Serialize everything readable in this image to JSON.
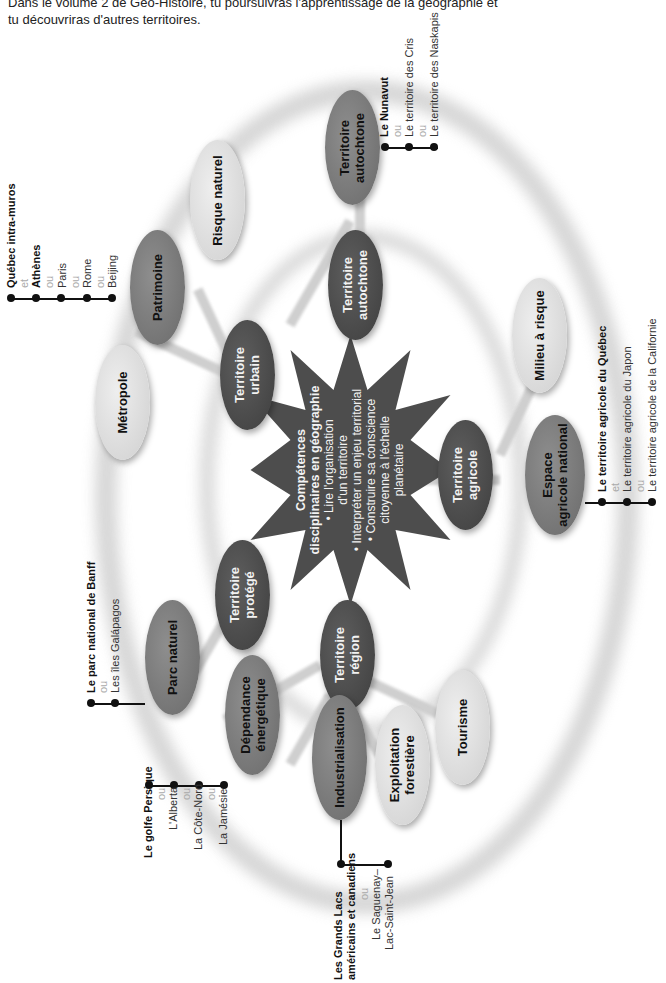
{
  "intro": {
    "line1": "Dans le volume 2 de Géo-Histoire, tu poursuivras l'apprentissage de la géographie et",
    "line2": "tu découvriras d'autres territoires."
  },
  "center": {
    "title_line1": "Compétences",
    "title_line2": "disciplinaires en géographie",
    "bullets": [
      "• Lire l'organisation",
      "d'un territoire",
      "• Interpréter un enjeu territorial",
      "• Construire sa conscience",
      "citoyenne à l'échelle",
      "planétaire"
    ]
  },
  "nodes": {
    "urbain": "Territoire\nurbain",
    "autochtone_inner": "Territoire\nautochtone",
    "agricole": "Territoire\nagricole",
    "region": "Territoire\nrégion",
    "protege": "Territoire\nprotégé",
    "metropole": "Métropole",
    "patrimoine": "Patrimoine",
    "risque_naturel": "Risque naturel",
    "autochtone_outer": "Territoire\nautochtone",
    "milieu_risque": "Milieu à risque",
    "espace_agricole": "Espace\nagricole national",
    "tourisme": "Tourisme",
    "exploitation": "Exploitation\nforestière",
    "industrialisation": "Industrialisation",
    "dependance": "Dépendance\nénergétique",
    "parc_naturel": "Parc naturel"
  },
  "examples": {
    "patrimoine": {
      "main": "Québec intra-muros",
      "c1": "et",
      "e1": "Athènes",
      "c2": "ou",
      "e2": "Paris",
      "c3": "ou",
      "e3": "Rome",
      "c4": "ou",
      "e4": "Beijing"
    },
    "autochtone": {
      "main": "Le Nunavut",
      "c1": "ou",
      "e1": "Le territoire des Cris",
      "c2": "ou",
      "e2": "Le territoire des Naskapis"
    },
    "agricole": {
      "main": "Le territoire agricole du Québec",
      "c1": "et",
      "e1": "Le territoire agricole du Japon",
      "c2": "ou",
      "e2": "Le territoire agricole de la Californie"
    },
    "parc": {
      "main": "Le parc national de Banff",
      "c1": "ou",
      "e1": "Les îles Galápagos"
    },
    "energie": {
      "main": "Le golfe Persique",
      "c1": "ou",
      "e1": "L'Alberta",
      "c2": "ou",
      "e2": "La Côte-Nord",
      "c3": "ou",
      "e3": "La Jamésie"
    },
    "industrie": {
      "main1": "Les Grands Lacs",
      "main2": "américains et canadiens",
      "c1": "ou",
      "e1a": "Le Saguenay–",
      "e1b": "Lac-Saint-Jean"
    }
  },
  "colors": {
    "dark_node": "#4a4a4a",
    "mid_node": "#7a7a7a",
    "light_node": "#dcdcdc",
    "star": "#4d4d4d",
    "ring": "#d2d2d2"
  }
}
